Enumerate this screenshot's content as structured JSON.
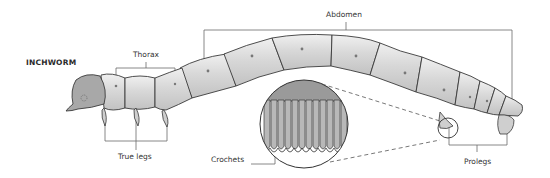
{
  "diagram": {
    "title": "INCHWORM",
    "labels": {
      "thorax": "Thorax",
      "abdomen": "Abdomen",
      "true_legs": "True legs",
      "crochets": "Crochets",
      "prolegs": "Prolegs"
    },
    "colors": {
      "body_fill": "#d8d8d8",
      "head_fill": "#a9a9a9",
      "outline": "#3a3a3a",
      "leader_line": "#666666",
      "background": "#ffffff"
    }
  }
}
